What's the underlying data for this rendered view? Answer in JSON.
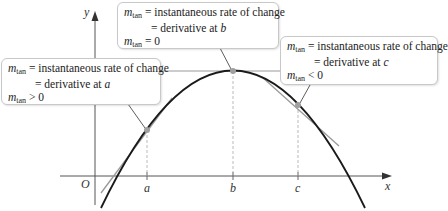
{
  "figure": {
    "axes": {
      "x_label": "x",
      "y_label": "y",
      "origin_label": "O",
      "ticks": [
        "a",
        "b",
        "c"
      ]
    },
    "colors": {
      "curve": "#1a1a1a",
      "tangent": "#9a9a9a",
      "point": "#a0a0a0",
      "axis": "#555555",
      "box_border": "#c8c8c8"
    },
    "callouts": [
      {
        "id": "a",
        "sym": "m",
        "sub": "tan",
        "line1": " = instantaneous rate of change",
        "line2_prefix": "= derivative at ",
        "line2_var": "a",
        "line3": " > 0"
      },
      {
        "id": "b",
        "sym": "m",
        "sub": "tan",
        "line1": " = instantaneous rate of change",
        "line2_prefix": "= derivative at ",
        "line2_var": "b",
        "line3": " = 0"
      },
      {
        "id": "c",
        "sym": "m",
        "sub": "tan",
        "line1": " = instantaneous rate of change",
        "line2_prefix": "= derivative at ",
        "line2_var": "c",
        "line3": " < 0"
      }
    ]
  }
}
